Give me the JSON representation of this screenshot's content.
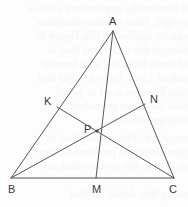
{
  "figure": {
    "canvas": {
      "width": 188,
      "height": 207
    },
    "stroke_color": "#555555",
    "label_color": "#3a3a3a",
    "background_color": "#fdfdfd"
  },
  "labels": {
    "A": "A",
    "B": "B",
    "C": "C",
    "K": "K",
    "N": "N",
    "M": "M",
    "P": "P"
  },
  "points": {
    "A": {
      "x": 113,
      "y": 31
    },
    "B": {
      "x": 11,
      "y": 178
    },
    "C": {
      "x": 174,
      "y": 178
    },
    "M": {
      "x": 96,
      "y": 178
    },
    "K": {
      "x": 57,
      "y": 107
    },
    "N": {
      "x": 145,
      "y": 104
    },
    "P": {
      "x": 97,
      "y": 131
    }
  },
  "segments": [
    {
      "name": "side-AB",
      "from": "A",
      "to": "B"
    },
    {
      "name": "side-AC",
      "from": "A",
      "to": "C"
    },
    {
      "name": "side-BC",
      "from": "B",
      "to": "C"
    },
    {
      "name": "cevian-AM",
      "from": "A",
      "to": "M"
    },
    {
      "name": "cevian-BN",
      "from": "B",
      "to": "N"
    },
    {
      "name": "cevian-CK",
      "from": "C",
      "to": "K"
    }
  ],
  "bleed_text": [
    "ll-known the appearance cases a",
    "e right. How similar situations",
    "can be applied to this figure in",
    "though the statement that is",
    "of these facts is a well-known",
    "sult of Ceva. Only a slight fact",
    "tion between a set of proof",
    "that the same geometric",
    "configuration is",
    "required. This means that in",
    "particular the problem of how",
    "to choose the cevians that are",
    "using this detail, so that"
  ]
}
